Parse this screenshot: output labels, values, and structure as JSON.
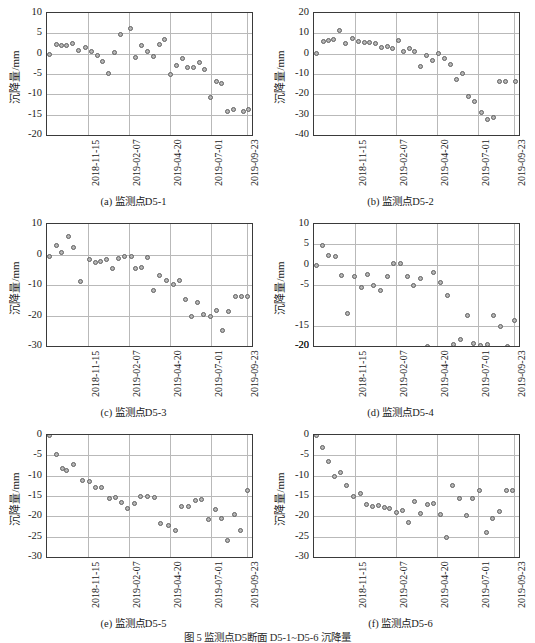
{
  "figure": {
    "caption": "图 5  监测点D5断面 D5-1~D5-6 沉降量",
    "ylabel": "沉降量/mm",
    "xticks": [
      "2018-11-15",
      "2019-02-07",
      "2019-04-20",
      "2019-07-01",
      "2019-09-23"
    ],
    "marker_fill": "#b6b6b6",
    "marker_stroke": "#5f5f5f",
    "grid_color": "#b9b9b9",
    "axis_color": "#3a3a3a"
  },
  "chart_data": [
    {
      "type": "scatter",
      "panel": "a",
      "title": "(a) 监测点D5-1",
      "xlabel": "",
      "ylabel": "沉降量/mm",
      "ylim": [
        -20,
        10
      ],
      "yticks": [
        10,
        5,
        0,
        -5,
        -10,
        -15,
        -20
      ],
      "xlim": [
        0,
        40
      ],
      "xtick_positions": [
        8,
        16,
        24,
        32,
        39
      ],
      "xtick_labels": [
        "2018-11-15",
        "2019-02-07",
        "2019-04-20",
        "2019-07-01",
        "2019-09-23"
      ],
      "grid": true,
      "x": [
        0.4,
        1.8,
        2.8,
        3.8,
        4.9,
        6.2,
        7.6,
        8.6,
        9.8,
        10.9,
        12.0,
        13.2,
        14.4,
        16.2,
        17.3,
        18.4,
        19.6,
        20.8,
        21.9,
        23.0,
        24.1,
        25.2,
        26.4,
        27.5,
        28.6,
        29.7,
        30.8,
        31.9,
        33.0,
        34.1,
        35.2,
        36.4,
        38.4,
        39.4
      ],
      "y": [
        -0.2,
        2.3,
        2.0,
        1.9,
        2.4,
        0.9,
        1.6,
        0.5,
        -0.4,
        -1.9,
        -4.8,
        0.3,
        4.6,
        6.2,
        -0.9,
        2.1,
        0.5,
        -0.8,
        2.2,
        3.6,
        -5.2,
        -2.9,
        -1.3,
        -3.4,
        -3.3,
        -2.2,
        -3.8,
        -10.8,
        -6.8,
        -7.4,
        -14.1,
        -13.7,
        -14.1,
        -13.7
      ]
    },
    {
      "type": "scatter",
      "panel": "b",
      "title": "(b) 监测点D5-2",
      "xlabel": "",
      "ylabel": "沉降量/mm",
      "ylim": [
        -40,
        20
      ],
      "yticks": [
        20,
        10,
        0,
        -10,
        -20,
        -30,
        -40
      ],
      "xlim": [
        0,
        40
      ],
      "xtick_positions": [
        8,
        16,
        24,
        32,
        39
      ],
      "xtick_labels": [
        "2018-11-15",
        "2019-02-07",
        "2019-04-20",
        "2019-07-01",
        "2019-09-23"
      ],
      "grid": true,
      "x": [
        0.4,
        1.8,
        2.8,
        3.8,
        4.9,
        6.2,
        7.6,
        8.6,
        9.8,
        10.9,
        12.0,
        13.2,
        14.4,
        15.4,
        16.4,
        17.5,
        18.6,
        19.7,
        20.8,
        22.0,
        23.2,
        24.3,
        25.4,
        26.6,
        27.8,
        29.0,
        30.2,
        31.4,
        32.6,
        33.8,
        35.0,
        36.2,
        37.4,
        39.3
      ],
      "y": [
        0.0,
        5.9,
        6.6,
        6.9,
        11.2,
        5.1,
        7.4,
        6.1,
        5.7,
        5.5,
        5.2,
        2.9,
        3.4,
        2.7,
        6.4,
        0.9,
        2.6,
        1.2,
        -6.5,
        -0.7,
        -3.5,
        0.3,
        -2.2,
        -5.2,
        -12.7,
        -9.8,
        -21.1,
        -23.5,
        -29.0,
        -32.5,
        -31.6,
        -13.8,
        -13.8,
        -13.8
      ]
    },
    {
      "type": "scatter",
      "panel": "c",
      "title": "(c) 监测点D5-3",
      "xlabel": "",
      "ylabel": "沉降量/mm",
      "ylim": [
        -30,
        10
      ],
      "yticks": [
        10,
        0,
        -10,
        -20,
        -30
      ],
      "xlim": [
        0,
        40
      ],
      "xtick_positions": [
        8,
        16,
        24,
        32,
        39
      ],
      "xtick_labels": [
        "2018-11-15",
        "2019-02-07",
        "2019-04-20",
        "2019-07-01",
        "2019-09-23"
      ],
      "grid": true,
      "x": [
        0.4,
        1.8,
        2.9,
        4.1,
        5.2,
        6.6,
        8.2,
        9.4,
        10.5,
        11.7,
        12.8,
        14.0,
        15.2,
        16.4,
        17.3,
        18.4,
        19.6,
        20.7,
        22.0,
        23.4,
        24.6,
        25.8,
        27.0,
        28.2,
        29.4,
        30.6,
        31.9,
        33.1,
        34.3,
        35.5,
        36.7,
        38.0,
        39.2
      ],
      "y": [
        -0.6,
        3.0,
        0.5,
        5.8,
        2.4,
        -8.9,
        -1.5,
        -2.7,
        -2.2,
        -1.6,
        -4.5,
        -1.4,
        -0.8,
        -0.7,
        -4.6,
        -4.4,
        -1.0,
        -11.8,
        -6.8,
        -8.6,
        -9.7,
        -8.4,
        -14.7,
        -20.2,
        -15.7,
        -19.7,
        -20.3,
        -18.5,
        -25.0,
        -18.8,
        -13.8,
        -13.8,
        -13.8
      ]
    },
    {
      "type": "scatter",
      "panel": "d",
      "title": "(d) 监测点D5-4",
      "xlabel": "",
      "ylabel": "沉降量/mm",
      "ylim": [
        -20,
        10
      ],
      "yticks": [
        10,
        5,
        0,
        -5,
        -20,
        -15,
        -20
      ],
      "xlim": [
        0,
        40
      ],
      "xtick_positions": [
        8,
        16,
        24,
        32,
        39
      ],
      "xtick_labels": [
        "2018-11-15",
        "2019-02-07",
        "2019-04-20",
        "2019-07-01",
        "2019-09-23"
      ],
      "grid": true,
      "x": [
        0.4,
        1.7,
        2.9,
        4.1,
        5.4,
        6.6,
        7.9,
        9.2,
        10.4,
        11.7,
        13.0,
        14.3,
        15.6,
        16.9,
        18.2,
        19.5,
        20.8,
        22.1,
        23.4,
        24.7,
        26.0,
        27.3,
        28.6,
        29.9,
        31.2,
        32.5,
        33.8,
        35.1,
        36.4,
        37.7,
        39.2
      ],
      "y": [
        -0.2,
        4.6,
        2.2,
        2.0,
        -2.7,
        -12.1,
        -2.8,
        -5.5,
        -2.4,
        -5.1,
        -6.3,
        -3.0,
        0.4,
        0.3,
        -3.0,
        -5.2,
        -3.3,
        -20.0,
        -2.0,
        -4.4,
        -7.6,
        -19.6,
        -18.4,
        -12.5,
        -19.5,
        -19.8,
        -19.6,
        -12.6,
        -15.1,
        -20.2,
        -13.7
      ]
    },
    {
      "type": "scatter",
      "panel": "e",
      "title": "(e) 监测点D5-5",
      "xlabel": "",
      "ylabel": "沉降量/mm",
      "ylim": [
        -30,
        0
      ],
      "yticks": [
        0,
        -5,
        -10,
        -15,
        -20,
        -25,
        -30
      ],
      "xlim": [
        0,
        40
      ],
      "xtick_positions": [
        8,
        16,
        24,
        32,
        39
      ],
      "xtick_labels": [
        "2018-11-15",
        "2019-02-07",
        "2019-04-20",
        "2019-07-01",
        "2019-09-23"
      ],
      "grid": true,
      "x": [
        0.4,
        1.8,
        3.0,
        3.9,
        5.2,
        7.0,
        8.2,
        9.5,
        10.7,
        12.2,
        13.4,
        14.6,
        15.8,
        17.0,
        18.3,
        19.7,
        21.0,
        22.2,
        23.8,
        25.0,
        26.2,
        27.6,
        28.9,
        30.2,
        31.5,
        32.8,
        34.0,
        35.2,
        36.5,
        37.8,
        39.2
      ],
      "y": [
        -0.2,
        -4.7,
        -8.2,
        -8.8,
        -7.2,
        -11.2,
        -11.4,
        -12.8,
        -13.0,
        -15.5,
        -15.3,
        -16.7,
        -18.0,
        -16.8,
        -15.2,
        -15.2,
        -15.4,
        -21.8,
        -22.2,
        -23.5,
        -17.7,
        -17.5,
        -16.0,
        -15.9,
        -20.8,
        -18.2,
        -20.5,
        -25.9,
        -19.5,
        -23.6,
        -13.7
      ]
    },
    {
      "type": "scatter",
      "panel": "f",
      "title": "(f) 监测点D5-6",
      "xlabel": "",
      "ylabel": "沉降量/mm",
      "ylim": [
        -30,
        0
      ],
      "yticks": [
        0,
        -5,
        -10,
        -15,
        -20,
        -25,
        -30
      ],
      "xlim": [
        0,
        40
      ],
      "xtick_positions": [
        8,
        16,
        24,
        32,
        39
      ],
      "xtick_labels": [
        "2018-11-15",
        "2019-02-07",
        "2019-04-20",
        "2019-07-01",
        "2019-09-23"
      ],
      "grid": true,
      "x": [
        0.4,
        1.7,
        2.9,
        4.0,
        5.2,
        6.4,
        7.8,
        9.0,
        10.3,
        11.5,
        12.6,
        13.7,
        14.8,
        16.0,
        17.2,
        18.4,
        19.6,
        20.8,
        22.1,
        23.4,
        24.6,
        25.8,
        27.1,
        28.4,
        29.7,
        31.0,
        32.3,
        33.6,
        34.9,
        36.2,
        37.5,
        38.8
      ],
      "y": [
        -0.2,
        -3.0,
        -6.6,
        -10.3,
        -9.1,
        -12.3,
        -15.1,
        -14.5,
        -17.2,
        -17.6,
        -17.3,
        -17.8,
        -18.0,
        -19.1,
        -18.6,
        -21.5,
        -16.3,
        -19.4,
        -17.2,
        -16.9,
        -19.6,
        -25.2,
        -12.4,
        -15.6,
        -19.9,
        -15.5,
        -13.7,
        -24.0,
        -20.6,
        -18.9,
        -13.7,
        -13.7
      ]
    }
  ]
}
